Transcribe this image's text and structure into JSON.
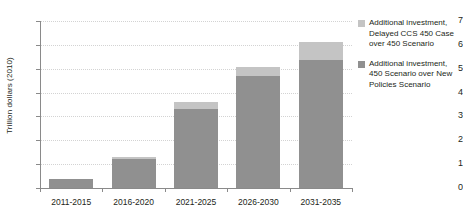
{
  "chart_data": {
    "type": "bar",
    "subtype": "stacked-vertical",
    "title": "",
    "xlabel": "",
    "ylabel": "Trillion dollars (2010)",
    "categories": [
      "2011-2015",
      "2016-2020",
      "2021-2025",
      "2026-2030",
      "2031-2035"
    ],
    "series": [
      {
        "name": "Additional investment, 450 Scenario over New Policies Scenario",
        "color": "#909090",
        "values": [
          0.38,
          1.22,
          3.3,
          4.68,
          5.35
        ]
      },
      {
        "name": "Additional investment, Delayed CCS 450 Case over 450 Scenario",
        "color": "#c4c4c4",
        "values": [
          0.0,
          0.06,
          0.3,
          0.4,
          0.75
        ]
      }
    ],
    "totals": [
      0.38,
      1.28,
      3.6,
      5.08,
      6.1
    ],
    "ylim": [
      0,
      7
    ],
    "yticks": [
      0,
      1,
      2,
      3,
      4,
      5,
      6,
      7
    ],
    "ytick_labels": [
      "0",
      "1",
      "2",
      "3",
      "4",
      "5",
      "6",
      "7"
    ],
    "grid": true,
    "grid_axis": "y",
    "grid_style": "dotted",
    "grid_color": "#d3d3d3",
    "legend_position": "right",
    "axis_color": "#8a8a8a",
    "background": "#ffffff"
  },
  "legend": {
    "items": [
      {
        "swatch_name": "legend-swatch-delayed-ccs",
        "color": "#c4c4c4",
        "label": "Additional investment, Delayed CCS 450 Case over 450 Scenario"
      },
      {
        "swatch_name": "legend-swatch-450-scenario",
        "color": "#909090",
        "label": "Additional investment, 450 Scenario over New Policies Scenario"
      }
    ]
  }
}
